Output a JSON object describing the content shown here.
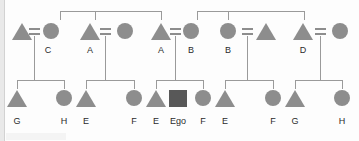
{
  "diagram": {
    "type": "kinship-pedigree-chart",
    "ego_label": "Ego",
    "colors": {
      "symbol_fill": "#8d8d8d",
      "ego_fill": "#585858",
      "line": "#9a9a9a",
      "label_text": "#2b2b2b",
      "background": "#fdfdfd"
    },
    "legend": {
      "triangle": "male",
      "circle": "female",
      "square": "ego",
      "equals": "marriage-link"
    },
    "generations": [
      {
        "name": "parental-generation",
        "row": 1,
        "persons": [
          {
            "id": "p1",
            "shape": "triangle",
            "label": "",
            "x": 22,
            "y": 26
          },
          {
            "id": "p2",
            "shape": "circle",
            "label": "C",
            "x": 48,
            "y": 26
          },
          {
            "id": "p3",
            "shape": "triangle",
            "label": "A",
            "x": 90,
            "y": 26
          },
          {
            "id": "p4",
            "shape": "circle",
            "label": "",
            "x": 124,
            "y": 26
          },
          {
            "id": "p5",
            "shape": "triangle",
            "label": "A",
            "x": 161,
            "y": 26
          },
          {
            "id": "p6",
            "shape": "circle",
            "label": "B",
            "x": 190,
            "y": 26
          },
          {
            "id": "p7",
            "shape": "circle",
            "label": "B",
            "x": 228,
            "y": 26
          },
          {
            "id": "p8",
            "shape": "triangle",
            "label": "",
            "x": 266,
            "y": 26
          },
          {
            "id": "p9",
            "shape": "triangle",
            "label": "D",
            "x": 303,
            "y": 26
          },
          {
            "id": "p10",
            "shape": "circle",
            "label": "",
            "x": 339,
            "y": 26
          }
        ],
        "marriages": [
          {
            "id": "m1",
            "x": 34,
            "left": "p1",
            "right": "p2"
          },
          {
            "id": "m2",
            "x": 105,
            "left": "p3",
            "right": "p4"
          },
          {
            "id": "m3",
            "x": 175,
            "left": "p5",
            "right": "p6"
          },
          {
            "id": "m4",
            "x": 247,
            "left": "p7",
            "right": "p8"
          },
          {
            "id": "m5",
            "x": 320,
            "left": "p9",
            "right": "p10"
          }
        ]
      },
      {
        "name": "ego-generation",
        "row": 2,
        "persons": [
          {
            "id": "c1",
            "shape": "triangle",
            "label": "G",
            "x": 17,
            "y": 92
          },
          {
            "id": "c2",
            "shape": "circle",
            "label": "H",
            "x": 64,
            "y": 92
          },
          {
            "id": "c3",
            "shape": "triangle",
            "label": "E",
            "x": 86,
            "y": 92
          },
          {
            "id": "c4",
            "shape": "circle",
            "label": "F",
            "x": 134,
            "y": 92
          },
          {
            "id": "c5",
            "shape": "triangle",
            "label": "E",
            "x": 156,
            "y": 92
          },
          {
            "id": "c6",
            "shape": "square",
            "label": "Ego",
            "x": 178,
            "y": 92
          },
          {
            "id": "c7",
            "shape": "circle",
            "label": "F",
            "x": 203,
            "y": 92
          },
          {
            "id": "c8",
            "shape": "triangle",
            "label": "E",
            "x": 225,
            "y": 92
          },
          {
            "id": "c9",
            "shape": "circle",
            "label": "F",
            "x": 273,
            "y": 92
          },
          {
            "id": "c10",
            "shape": "triangle",
            "label": "G",
            "x": 295,
            "y": 92
          },
          {
            "id": "c11",
            "shape": "circle",
            "label": "H",
            "x": 342,
            "y": 92
          }
        ]
      }
    ],
    "sibling_brackets_top": [
      {
        "id": "tb1",
        "y": 11,
        "left": 60,
        "right": 161,
        "drops": [
          60,
          95,
          161
        ]
      },
      {
        "id": "tb2",
        "y": 11,
        "left": 197,
        "right": 304,
        "drops": [
          197,
          228,
          304
        ]
      }
    ],
    "sibling_brackets_bottom": [
      {
        "id": "bb1",
        "y": 80,
        "left": 17,
        "right": 64,
        "parent_x": 40,
        "drops": [
          17,
          64
        ]
      },
      {
        "id": "bb2",
        "y": 80,
        "left": 86,
        "right": 134,
        "parent_x": 110,
        "drops": [
          86,
          134
        ]
      },
      {
        "id": "bb3",
        "y": 80,
        "left": 156,
        "right": 203,
        "parent_x": 178,
        "drops": [
          156,
          203
        ]
      },
      {
        "id": "bb4",
        "y": 80,
        "left": 225,
        "right": 273,
        "parent_x": 249,
        "drops": [
          225,
          273
        ]
      },
      {
        "id": "bb5",
        "y": 80,
        "left": 295,
        "right": 342,
        "parent_x": 320,
        "drops": [
          295,
          342
        ]
      }
    ]
  }
}
